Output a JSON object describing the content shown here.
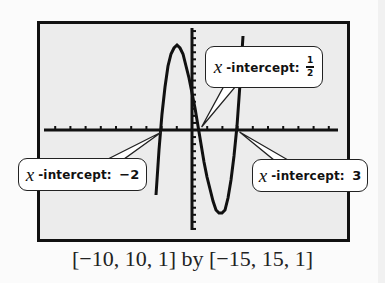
{
  "chart_data": {
    "type": "line",
    "title": "",
    "function": "f(x) = (x + 2)(2x - 1)(x - 3)",
    "xlim": [
      -10,
      10
    ],
    "ylim": [
      -15,
      15
    ],
    "xscl": 1,
    "yscl": 1,
    "x_intercepts": [
      -2,
      0.5,
      3
    ],
    "local_max": {
      "x": -1,
      "y": 12
    },
    "local_min": {
      "x": 2,
      "y": -12
    },
    "grid": false,
    "annotations": [
      {
        "text": "x-intercept: -2",
        "x": -2,
        "y": 0
      },
      {
        "text": "x-intercept: 1/2",
        "x": 0.5,
        "y": 0
      },
      {
        "text": "x-intercept: 3",
        "x": 3,
        "y": 0
      }
    ],
    "window_caption": "[−10, 10, 1] by [−15, 15, 1]"
  },
  "callouts": {
    "left": {
      "var": "x",
      "label": "-intercept:",
      "value": "−2"
    },
    "top": {
      "var": "x",
      "label": "-intercept:",
      "num": "1",
      "den": "2"
    },
    "right": {
      "var": "x",
      "label": "-intercept:",
      "value": "3"
    }
  },
  "caption": "[−10, 10, 1] by [−15, 15, 1]",
  "colors": {
    "screen_bg": "#ececec",
    "ink": "#111111",
    "callout_bg": "#ffffff"
  }
}
